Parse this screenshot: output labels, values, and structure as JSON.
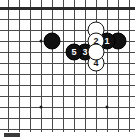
{
  "diagram": {
    "kind": "go-board-diagram",
    "game": "Go",
    "caption": "",
    "board": {
      "columns": 12,
      "rows": 12,
      "cell_size": 11,
      "origin_x": 8,
      "origin_y": 8,
      "top_edge_is_board_boundary": true,
      "background_color": "#ffffff",
      "line_color": "#4a4a4a",
      "edge_color": "#2b2b2b"
    },
    "colors": {
      "black_stone": "#111111",
      "white_stone": "#ffffff",
      "black_label": "#ffffff",
      "white_label": "#111111",
      "star_point": "#1a1a1a"
    },
    "star_points": [
      {
        "col": 3,
        "row": 3
      },
      {
        "col": 3,
        "row": 9
      },
      {
        "col": 9,
        "row": 9
      }
    ],
    "stones": [
      {
        "id": "s-black-left",
        "color": "black",
        "label": "",
        "col": 4,
        "row": 3
      },
      {
        "id": "s-white-top",
        "color": "white",
        "label": "",
        "col": 8,
        "row": 2
      },
      {
        "id": "s-black-right",
        "color": "black",
        "label": "",
        "col": 10,
        "row": 3
      },
      {
        "id": "s-move-1",
        "color": "black",
        "label": "1",
        "col": 9,
        "row": 3
      },
      {
        "id": "s-move-2",
        "color": "white",
        "label": "2",
        "col": 8,
        "row": 3
      },
      {
        "id": "s-move-3",
        "color": "black",
        "label": "3",
        "col": 7,
        "row": 4
      },
      {
        "id": "s-move-4",
        "color": "white",
        "label": "4",
        "col": 8,
        "row": 5
      },
      {
        "id": "s-move-5",
        "color": "black",
        "label": "5",
        "col": 6,
        "row": 4
      },
      {
        "id": "s-white-mid",
        "color": "white",
        "label": "",
        "col": 8,
        "row": 4
      }
    ],
    "move_sequence": [
      "1",
      "2",
      "3",
      "4",
      "5"
    ]
  }
}
